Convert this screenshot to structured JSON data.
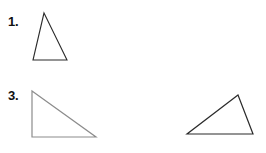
{
  "page": {
    "background_color": "#ffffff",
    "width": 266,
    "height": 153
  },
  "figures": [
    {
      "id": "figure-1",
      "label": "1.",
      "shape_name": "isosceles-triangle",
      "stroke_color": "#2b2b2b",
      "stroke_width": 1.1,
      "fill": "none",
      "viewbox": "0 0 44 56",
      "points": "14,5 37,52 3,52"
    },
    {
      "id": "figure-2",
      "label": "2.",
      "shape_name": "equilateral-triangle",
      "stroke_color": "#b9b9b9",
      "stroke_width": 1.1,
      "fill": "none",
      "viewbox": "0 0 70 58",
      "points": "34,6 64,53 4,53"
    },
    {
      "id": "figure-3",
      "label": "3.",
      "shape_name": "right-triangle",
      "stroke_color": "#8c8c8c",
      "stroke_width": 1.2,
      "fill": "none",
      "viewbox": "0 0 74 56",
      "points": "6,4 70,50 6,50"
    },
    {
      "id": "figure-4",
      "label": "4.",
      "shape_name": "scalene-obtuse-triangle",
      "stroke_color": "#2b2b2b",
      "stroke_width": 1.2,
      "fill": "none",
      "viewbox": "0 0 72 48",
      "points": "55,4 70,43 4,43"
    }
  ]
}
